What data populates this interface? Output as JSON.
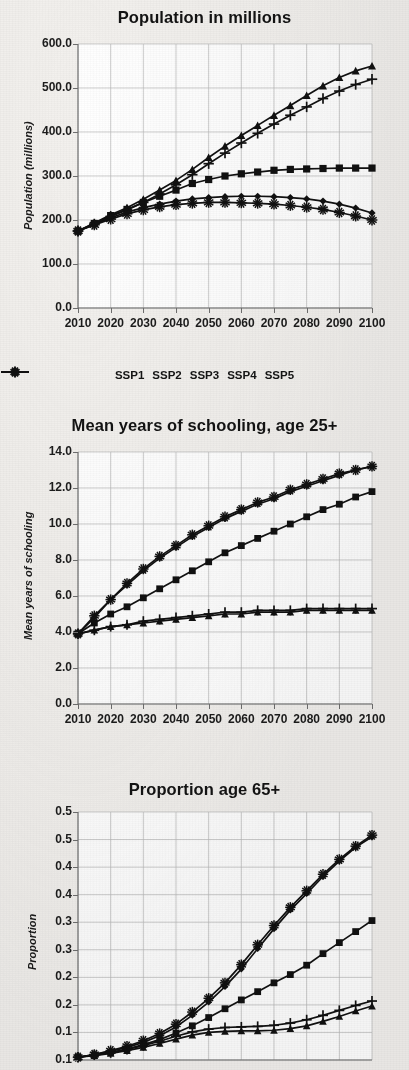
{
  "figure": {
    "background": "#f2f0ed",
    "plot_background": "#ffffff",
    "line_color": "#111111",
    "grid_color": "#b9b9b9"
  },
  "legend": {
    "position": "below-first-chart",
    "items": [
      {
        "label": "SSP1",
        "marker": "diamond-marker-icon"
      },
      {
        "label": "SSP2",
        "marker": "square-marker-icon"
      },
      {
        "label": "SSP3",
        "marker": "triangle-marker-icon"
      },
      {
        "label": "SSP4",
        "marker": "plus-marker-icon"
      },
      {
        "label": "SSP5",
        "marker": "asterisk-marker-icon"
      }
    ]
  },
  "chart_data": [
    {
      "id": "population",
      "type": "line",
      "title": "Population in millions",
      "xlabel": "",
      "ylabel": "Population (millions)",
      "x": [
        2010,
        2015,
        2020,
        2025,
        2030,
        2035,
        2040,
        2045,
        2050,
        2055,
        2060,
        2065,
        2070,
        2075,
        2080,
        2085,
        2090,
        2095,
        2100
      ],
      "xlim": [
        2010,
        2100
      ],
      "ylim": [
        0.0,
        600.0
      ],
      "xticks": [
        "2010",
        "2020",
        "2030",
        "2040",
        "2050",
        "2060",
        "2070",
        "2080",
        "2090",
        "2100"
      ],
      "xtick_values": [
        2010,
        2020,
        2030,
        2040,
        2050,
        2060,
        2070,
        2080,
        2090,
        2100
      ],
      "yticks": [
        "0.0",
        "100.0",
        "200.0",
        "300.0",
        "400.0",
        "500.0",
        "600.0"
      ],
      "ytick_values": [
        0,
        100,
        200,
        300,
        400,
        500,
        600
      ],
      "grid": true,
      "legend_position": "bottom",
      "series": [
        {
          "name": "SSP1",
          "marker": "diamond",
          "values": [
            175,
            190,
            205,
            218,
            228,
            236,
            243,
            248,
            251,
            253,
            254,
            254,
            253,
            251,
            248,
            243,
            236,
            227,
            216
          ]
        },
        {
          "name": "SSP2",
          "marker": "square",
          "values": [
            175,
            192,
            210,
            224,
            240,
            254,
            268,
            283,
            292,
            300,
            305,
            309,
            313,
            315,
            316,
            317,
            318,
            318,
            318
          ]
        },
        {
          "name": "SSP3",
          "marker": "triangle",
          "values": [
            175,
            193,
            212,
            228,
            247,
            268,
            290,
            315,
            342,
            368,
            392,
            415,
            438,
            460,
            483,
            505,
            524,
            539,
            550
          ]
        },
        {
          "name": "SSP4",
          "marker": "plus",
          "values": [
            175,
            191,
            208,
            223,
            240,
            259,
            280,
            303,
            328,
            352,
            375,
            397,
            418,
            438,
            457,
            476,
            493,
            508,
            520
          ]
        },
        {
          "name": "SSP5",
          "marker": "asterisk",
          "values": [
            175,
            189,
            202,
            214,
            223,
            230,
            235,
            238,
            240,
            240,
            239,
            238,
            236,
            233,
            229,
            224,
            217,
            209,
            200
          ]
        }
      ]
    },
    {
      "id": "schooling",
      "type": "line",
      "title": "Mean years of schooling, age 25+",
      "xlabel": "",
      "ylabel": "Mean years of schooling",
      "x": [
        2010,
        2015,
        2020,
        2025,
        2030,
        2035,
        2040,
        2045,
        2050,
        2055,
        2060,
        2065,
        2070,
        2075,
        2080,
        2085,
        2090,
        2095,
        2100
      ],
      "xlim": [
        2010,
        2100
      ],
      "ylim": [
        0.0,
        14.0
      ],
      "xticks": [
        "2010",
        "2020",
        "2030",
        "2040",
        "2050",
        "2060",
        "2070",
        "2080",
        "2090",
        "2100"
      ],
      "xtick_values": [
        2010,
        2020,
        2030,
        2040,
        2050,
        2060,
        2070,
        2080,
        2090,
        2100
      ],
      "yticks": [
        "0.0",
        "2.0",
        "4.0",
        "6.0",
        "8.0",
        "10.0",
        "12.0",
        "14.0"
      ],
      "ytick_values": [
        0,
        2,
        4,
        6,
        8,
        10,
        12,
        14
      ],
      "grid": true,
      "series": [
        {
          "name": "SSP1",
          "marker": "diamond",
          "values": [
            3.9,
            4.8,
            5.8,
            6.6,
            7.4,
            8.1,
            8.7,
            9.3,
            9.8,
            10.3,
            10.7,
            11.1,
            11.4,
            11.8,
            12.1,
            12.4,
            12.7,
            13.0,
            13.2
          ]
        },
        {
          "name": "SSP2",
          "marker": "square",
          "values": [
            3.9,
            4.5,
            5.0,
            5.4,
            5.9,
            6.4,
            6.9,
            7.4,
            7.9,
            8.4,
            8.8,
            9.2,
            9.6,
            10.0,
            10.4,
            10.8,
            11.1,
            11.5,
            11.8
          ]
        },
        {
          "name": "SSP3",
          "marker": "triangle",
          "values": [
            3.9,
            4.1,
            4.3,
            4.4,
            4.5,
            4.6,
            4.7,
            4.8,
            4.9,
            5.0,
            5.0,
            5.1,
            5.1,
            5.1,
            5.2,
            5.2,
            5.2,
            5.2,
            5.2
          ]
        },
        {
          "name": "SSP4",
          "marker": "plus",
          "values": [
            3.9,
            4.1,
            4.3,
            4.4,
            4.6,
            4.7,
            4.8,
            4.9,
            5.0,
            5.1,
            5.1,
            5.2,
            5.2,
            5.2,
            5.3,
            5.3,
            5.3,
            5.3,
            5.3
          ]
        },
        {
          "name": "SSP5",
          "marker": "asterisk",
          "values": [
            3.9,
            4.9,
            5.8,
            6.7,
            7.5,
            8.2,
            8.8,
            9.4,
            9.9,
            10.4,
            10.8,
            11.2,
            11.5,
            11.9,
            12.2,
            12.5,
            12.8,
            13.0,
            13.2
          ]
        }
      ]
    },
    {
      "id": "proportion65",
      "type": "line",
      "title": "Proportion age 65+",
      "xlabel": "",
      "ylabel": "Proportion",
      "x": [
        2010,
        2015,
        2020,
        2025,
        2030,
        2035,
        2040,
        2045,
        2050,
        2055,
        2060,
        2065,
        2070,
        2075,
        2080,
        2085,
        2090,
        2095,
        2100
      ],
      "xlim": [
        2010,
        2100
      ],
      "ylim": [
        0.05,
        0.5
      ],
      "xticks": [],
      "xtick_values": [],
      "yticks": [
        "0.5",
        "0.5",
        "0.4",
        "0.4",
        "0.3",
        "0.3",
        "0.2",
        "0.2",
        "0.1",
        "0.1"
      ],
      "ytick_values": [
        0.5,
        0.45,
        0.4,
        0.35,
        0.3,
        0.25,
        0.2,
        0.15,
        0.1,
        0.05
      ],
      "grid": true,
      "note": "bottom of this panel is cropped by the screenshot edge",
      "series": [
        {
          "name": "SSP1",
          "marker": "diamond",
          "values": [
            0.055,
            0.06,
            0.066,
            0.073,
            0.082,
            0.094,
            0.11,
            0.131,
            0.155,
            0.183,
            0.215,
            0.252,
            0.288,
            0.322,
            0.352,
            0.383,
            0.411,
            0.436,
            0.455
          ]
        },
        {
          "name": "SSP2",
          "marker": "square",
          "values": [
            0.055,
            0.059,
            0.064,
            0.07,
            0.078,
            0.087,
            0.099,
            0.112,
            0.127,
            0.143,
            0.159,
            0.174,
            0.19,
            0.205,
            0.222,
            0.243,
            0.263,
            0.283,
            0.303
          ]
        },
        {
          "name": "SSP3",
          "marker": "triangle",
          "values": [
            0.055,
            0.058,
            0.062,
            0.067,
            0.073,
            0.08,
            0.088,
            0.095,
            0.1,
            0.102,
            0.103,
            0.103,
            0.104,
            0.107,
            0.112,
            0.12,
            0.129,
            0.139,
            0.148
          ]
        },
        {
          "name": "SSP4",
          "marker": "plus",
          "values": [
            0.055,
            0.059,
            0.063,
            0.069,
            0.076,
            0.084,
            0.093,
            0.101,
            0.106,
            0.109,
            0.11,
            0.111,
            0.113,
            0.117,
            0.123,
            0.131,
            0.14,
            0.149,
            0.157
          ]
        },
        {
          "name": "SSP5",
          "marker": "asterisk",
          "values": [
            0.055,
            0.06,
            0.067,
            0.075,
            0.085,
            0.098,
            0.115,
            0.137,
            0.162,
            0.19,
            0.223,
            0.259,
            0.294,
            0.327,
            0.357,
            0.387,
            0.414,
            0.438,
            0.458
          ]
        }
      ]
    }
  ]
}
